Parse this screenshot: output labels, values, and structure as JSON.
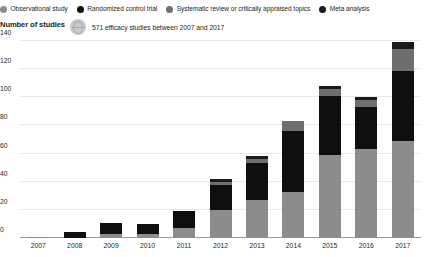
{
  "legend": {
    "items": [
      {
        "label": "Observational study",
        "color": "#8c8c8c",
        "marker": "circle-marker"
      },
      {
        "label": "Randomized control trial",
        "color": "#0f0f0f",
        "marker": "circle-marker"
      },
      {
        "label": "Systematic review or critically appraised topics",
        "color": "#6e6e6e",
        "marker": "circle-marker"
      },
      {
        "label": "Meta analysis",
        "color": "#1a1a1a",
        "marker": "circle-marker"
      }
    ]
  },
  "axis_title": "Number of studies",
  "annotation": {
    "icon": "globe-icon",
    "text": "571 efficacy studies between 2007 and 2017"
  },
  "chart_data": {
    "type": "bar",
    "title": "",
    "subtitle": "571 efficacy studies between 2007 and 2017",
    "xlabel": "",
    "ylabel": "Number of studies",
    "ylim": [
      0,
      140
    ],
    "yticks": [
      0,
      20,
      40,
      60,
      80,
      100,
      120,
      140
    ],
    "ytick_labels": [
      "0",
      "20",
      "40",
      "60",
      "80",
      "100",
      "120",
      "140"
    ],
    "grid": true,
    "stacked": true,
    "legend_position": "top",
    "categories": [
      "2007",
      "2008",
      "2009",
      "2010",
      "2011",
      "2012",
      "2013",
      "2014",
      "2015",
      "2016",
      "2017"
    ],
    "series": [
      {
        "name": "Observational study",
        "color": "#8c8c8c",
        "values": [
          1,
          0,
          3,
          3,
          7,
          20,
          27,
          33,
          59,
          63,
          69
        ]
      },
      {
        "name": "Randomized control trial",
        "color": "#0f0f0f",
        "values": [
          0,
          4,
          8,
          7,
          12,
          18,
          26,
          43,
          42,
          30,
          50
        ]
      },
      {
        "name": "Systematic review or critically appraised topics",
        "color": "#6e6e6e",
        "values": [
          0,
          0,
          0,
          0,
          0,
          2,
          3,
          7,
          5,
          5,
          15
        ]
      },
      {
        "name": "Meta analysis",
        "color": "#1a1a1a",
        "values": [
          0,
          0,
          0,
          0,
          0,
          2,
          2,
          0,
          2,
          2,
          5
        ]
      }
    ],
    "totals": [
      1,
      4,
      11,
      10,
      19,
      42,
      58,
      83,
      108,
      100,
      139
    ]
  }
}
